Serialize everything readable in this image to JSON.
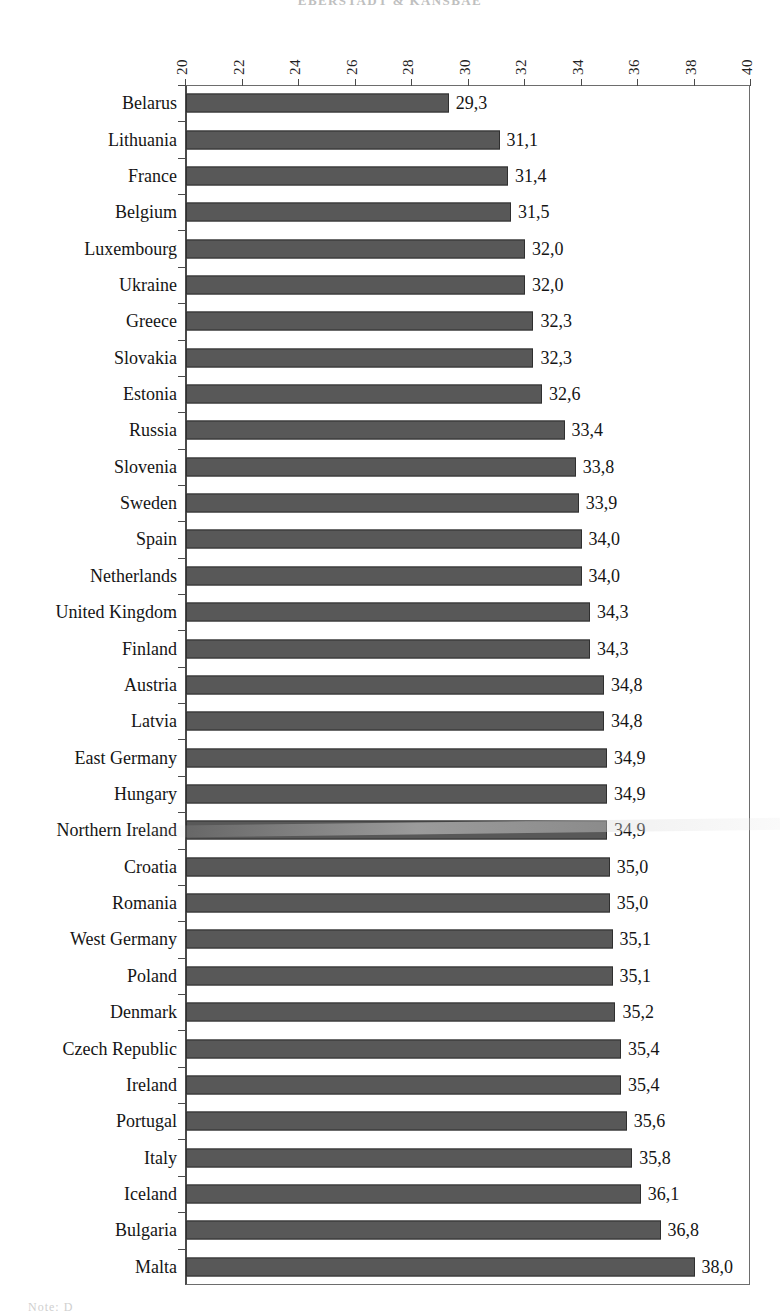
{
  "page": {
    "running_header": "EBERSTADT & KANSBAE",
    "bottom_cut_text": "Note: D"
  },
  "chart_data": {
    "type": "bar",
    "orientation": "horizontal",
    "title": "",
    "xlabel": "",
    "ylabel": "",
    "xlim": [
      20,
      40
    ],
    "xticks": [
      20,
      22,
      24,
      26,
      28,
      30,
      32,
      34,
      36,
      38,
      40
    ],
    "xtick_labels": [
      "20",
      "22",
      "24",
      "26",
      "28",
      "30",
      "32",
      "34",
      "36",
      "38",
      "40"
    ],
    "axis_position": "top",
    "grid": false,
    "legend": null,
    "decimal_separator": ",",
    "bar_color": "#585858",
    "bar_edge_color": "#2f2f2f",
    "categories": [
      "Belarus",
      "Lithuania",
      "France",
      "Belgium",
      "Luxembourg",
      "Ukraine",
      "Greece",
      "Slovakia",
      "Estonia",
      "Russia",
      "Slovenia",
      "Sweden",
      "Spain",
      "Netherlands",
      "United Kingdom",
      "Finland",
      "Austria",
      "Latvia",
      "East Germany",
      "Hungary",
      "Northern Ireland",
      "Croatia",
      "Romania",
      "West Germany",
      "Poland",
      "Denmark",
      "Czech Republic",
      "Ireland",
      "Portugal",
      "Italy",
      "Iceland",
      "Bulgaria",
      "Malta"
    ],
    "values": [
      29.3,
      31.1,
      31.4,
      31.5,
      32.0,
      32.0,
      32.3,
      32.3,
      32.6,
      33.4,
      33.8,
      33.9,
      34.0,
      34.0,
      34.3,
      34.3,
      34.8,
      34.8,
      34.9,
      34.9,
      34.9,
      35.0,
      35.0,
      35.1,
      35.1,
      35.2,
      35.4,
      35.4,
      35.6,
      35.8,
      36.1,
      36.8,
      38.0
    ],
    "value_labels": [
      "29,3",
      "31,1",
      "31,4",
      "31,5",
      "32,0",
      "32,0",
      "32,3",
      "32,3",
      "32,6",
      "33,4",
      "33,8",
      "33,9",
      "34,0",
      "34,0",
      "34,3",
      "34,3",
      "34,8",
      "34,8",
      "34,9",
      "34,9",
      "34,9",
      "35,0",
      "35,0",
      "35,1",
      "35,1",
      "35,2",
      "35,4",
      "35,4",
      "35,6",
      "35,8",
      "36,1",
      "36,8",
      "38,0"
    ]
  }
}
